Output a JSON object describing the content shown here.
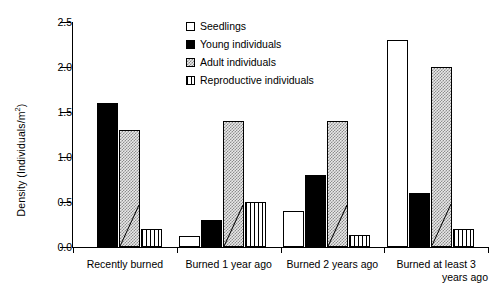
{
  "chart_data": {
    "type": "bar",
    "title": "",
    "xlabel": "",
    "ylabel": "Density (Individuals/m2)",
    "ylabel_base": "Density (Individuals/m",
    "ylabel_exponent": "2",
    "ylabel_tail": ")",
    "categories": [
      "Recently burned",
      "Burned 1 year ago",
      "Burned 2 years ago",
      "Burned at least 3 years ago"
    ],
    "category_lines": [
      [
        "Recently burned"
      ],
      [
        "Burned 1 year ago"
      ],
      [
        "Burned 2 years ago"
      ],
      [
        "Burned at least 3",
        "years ago"
      ]
    ],
    "series": [
      {
        "name": "Seedlings",
        "fill": "seedlings",
        "values": [
          0,
          0.12,
          0.4,
          2.3
        ]
      },
      {
        "name": "Young individuals",
        "fill": "young",
        "values": [
          1.6,
          0.3,
          0.8,
          0.6
        ]
      },
      {
        "name": "Adult individuals",
        "fill": "adult",
        "values": [
          1.3,
          1.4,
          1.4,
          2.0
        ]
      },
      {
        "name": "Reproductive individuals",
        "fill": "repro",
        "values": [
          0.2,
          0.5,
          0.13,
          0.2
        ]
      }
    ],
    "ylim": [
      0,
      2.5
    ],
    "ytick_values": [
      0.0,
      0.5,
      1.0,
      1.5,
      2.0,
      2.5
    ],
    "ytick_labels": [
      "0.0",
      "0.5",
      "1.0",
      "1.5",
      "2.0",
      "2.5"
    ],
    "grid": false,
    "legend_position": "top-center",
    "legend_entries": [
      "Seedlings",
      "Young individuals",
      "Adult individuals",
      "Reproductive individuals"
    ],
    "colors": {
      "seedlings": "#ffffff",
      "young": "#000000",
      "adult": "#d9d9d9",
      "repro": "#ffffff",
      "axis": "#000000"
    }
  }
}
